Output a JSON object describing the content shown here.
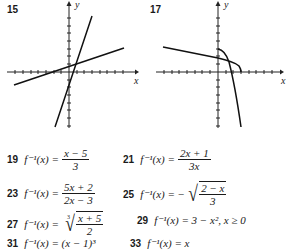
{
  "graphs": [
    {
      "number": "15",
      "x_label": "x",
      "y_label": "y",
      "curves": [
        "line y = 3x - 1 (approx.)",
        "line y = (x+5)/3 inverse"
      ]
    },
    {
      "number": "17",
      "x_label": "x",
      "y_label": "y",
      "curves": [
        "decreasing curve from y-axis",
        "reflected inverse curve"
      ]
    }
  ],
  "answers": [
    {
      "number": "19",
      "lhs": "f⁻¹(x) =",
      "num": "x − 5",
      "den": "3"
    },
    {
      "number": "21",
      "lhs": "f⁻¹(x) =",
      "num": "2x + 1",
      "den": "3x"
    },
    {
      "number": "23",
      "lhs": "f⁻¹(x) =",
      "num": "5x + 2",
      "den": "2x − 3"
    },
    {
      "number": "25",
      "lhs": "f⁻¹(x) = −",
      "num": "2 − x",
      "den": "3"
    },
    {
      "number": "27",
      "lhs": "f⁻¹(x) =",
      "index": "3",
      "num": "x + 5",
      "den": "2"
    },
    {
      "number": "29",
      "text": "f⁻¹(x) = 3 − x², x ≥ 0"
    },
    {
      "number": "31",
      "text": "f⁻¹(x) = (x − 1)³"
    },
    {
      "number": "33",
      "text": "f⁻¹(x) = x"
    }
  ]
}
